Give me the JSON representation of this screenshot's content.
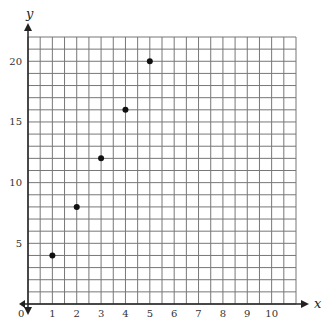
{
  "chart_data": {
    "type": "scatter",
    "title": "",
    "xlabel": "x",
    "ylabel": "y",
    "x": [
      1,
      2,
      3,
      4,
      5
    ],
    "y": [
      4,
      8,
      12,
      16,
      20
    ],
    "series": [
      {
        "name": "points",
        "x": [
          1,
          2,
          3,
          4,
          5
        ],
        "y": [
          4,
          8,
          12,
          16,
          20
        ]
      }
    ],
    "x_ticks": [
      "1",
      "2",
      "3",
      "4",
      "5",
      "6",
      "7",
      "8",
      "9",
      "10"
    ],
    "y_ticks": [
      "5",
      "10",
      "15",
      "20"
    ],
    "origin_label": "0",
    "xlim": [
      0,
      11
    ],
    "ylim": [
      0,
      22
    ],
    "grid": true,
    "x_grid_step": 0.5,
    "y_grid_step": 1,
    "colors": {
      "grid": "#777777",
      "axis": "#222222",
      "point": "#111111"
    }
  }
}
